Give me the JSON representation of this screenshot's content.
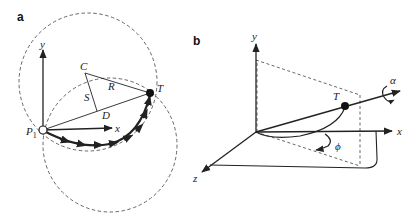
{
  "figure": {
    "panel_a": {
      "panel_label": "a",
      "axes": {
        "x": "x",
        "y": "y"
      },
      "points": {
        "start": "P",
        "start_sub": "1",
        "target": "T",
        "center": "C"
      },
      "segment_labels": {
        "radius": "R",
        "sagitta": "S",
        "chord": "D"
      }
    },
    "panel_b": {
      "panel_label": "b",
      "axes": {
        "x": "x",
        "y": "y",
        "z": "z"
      },
      "points": {
        "target": "T"
      },
      "angles": {
        "roll": "α",
        "azimuth": "ϕ"
      }
    },
    "colors": {
      "ink": "#222222",
      "dashed": "#555555",
      "background": "#ffffff"
    }
  }
}
